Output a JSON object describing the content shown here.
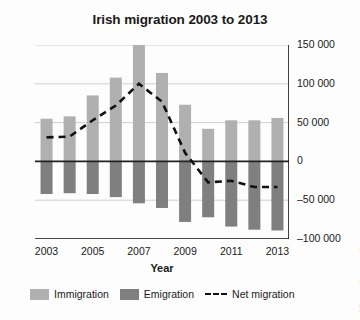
{
  "chart_data": {
    "type": "bar",
    "title": "Irish migration 2003 to 2013",
    "xlabel": "Year",
    "ylabel": "No. of people",
    "grid": true,
    "legend_position": "bottom",
    "categories": [
      "2003",
      "2004",
      "2005",
      "2006",
      "2007",
      "2008",
      "2009",
      "2010",
      "2011",
      "2012",
      "2013"
    ],
    "x_tick_labels": [
      "2003",
      "2005",
      "2007",
      "2009",
      "2011",
      "2013"
    ],
    "y_tick_labels": [
      "150 000",
      "100 000",
      "50 000",
      "0",
      "–50 000",
      "–100 000"
    ],
    "y_tick_values": [
      150000,
      100000,
      50000,
      0,
      -50000,
      -100000
    ],
    "ylim": [
      -100000,
      150000
    ],
    "series": [
      {
        "name": "Immigration",
        "type": "bar",
        "color": "#b0b0b0",
        "values": [
          55000,
          58000,
          85000,
          108000,
          151000,
          114000,
          73000,
          42000,
          53000,
          53000,
          56000
        ]
      },
      {
        "name": "Emigration",
        "type": "bar",
        "color": "#7f7f7f",
        "values": [
          -42000,
          -41000,
          -42000,
          -46000,
          -54000,
          -60000,
          -78000,
          -72000,
          -84000,
          -88000,
          -89000
        ]
      },
      {
        "name": "Net migration",
        "type": "line",
        "style": "dashed",
        "color": "#111111",
        "values": [
          31000,
          32000,
          53000,
          72000,
          100000,
          77000,
          11000,
          -27000,
          -25000,
          -33000,
          -33000
        ]
      }
    ]
  },
  "legend": {
    "items": [
      {
        "label": "Immigration",
        "marker": "swatch",
        "color": "#b0b0b0"
      },
      {
        "label": "Emigration",
        "marker": "swatch",
        "color": "#7f7f7f"
      },
      {
        "label": "Net migration",
        "marker": "dashed-line",
        "color": "#111111"
      }
    ]
  }
}
